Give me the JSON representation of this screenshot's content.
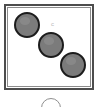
{
  "scene": {
    "title": "Three gray discs in a square frame",
    "width": 99,
    "height": 107,
    "background_color": "#ffffff"
  },
  "frame": {
    "name": "square-frame",
    "x": 4,
    "y": 4,
    "width": 90,
    "height": 86,
    "outer_border_color": "#4d4d4d",
    "inner_border_color": "#8c8c8c",
    "fill_color": "#ffffff"
  },
  "discs": [
    {
      "label": "disc-top-left",
      "cx": 27,
      "cy": 25,
      "r": 13,
      "fill": "#7b7b7b",
      "stroke": "#1c1c1c"
    },
    {
      "label": "disc-middle",
      "cx": 51,
      "cy": 45,
      "r": 13,
      "fill": "#7b7b7b",
      "stroke": "#1c1c1c"
    },
    {
      "label": "disc-bottom-right",
      "cx": 73,
      "cy": 65,
      "r": 13,
      "fill": "#7b7b7b",
      "stroke": "#1c1c1c"
    }
  ],
  "speck": {
    "label": "faint-mark",
    "glyph": "c",
    "x": 51,
    "y": 21,
    "color": "#b9b9b9"
  },
  "bottom_arc": {
    "label": "partial-circle-outline",
    "cx": 51,
    "cy": 108,
    "r": 10,
    "stroke": "#8f8f8f"
  }
}
